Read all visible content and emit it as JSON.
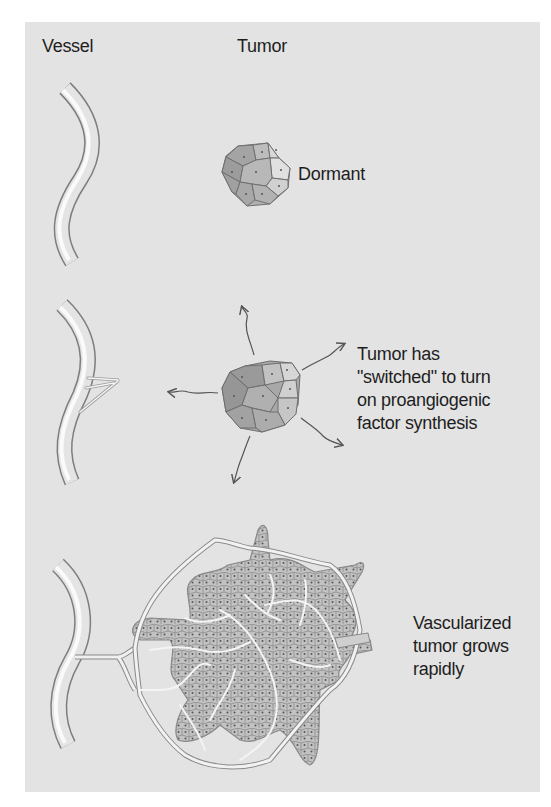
{
  "headers": {
    "vessel": "Vessel",
    "tumor": "Tumor"
  },
  "stages": [
    {
      "name": "dormant",
      "label_lines": [
        "Dormant"
      ]
    },
    {
      "name": "switched",
      "label_lines": [
        "Tumor has",
        "\"switched\" to turn",
        "on proangiogenic",
        "factor synthesis"
      ]
    },
    {
      "name": "vascularized",
      "label_lines": [
        "Vascularized",
        "tumor grows",
        "rapidly"
      ]
    }
  ],
  "colors": {
    "background": "#e3e3e3",
    "text": "#1e1e1e",
    "vessel_light": "#f2f2f2",
    "vessel_dark": "#8a8a8a",
    "cell_dark": "#9a9a9a",
    "cell_mid": "#b4b4b4",
    "cell_light": "#d8d8d8",
    "cell_border": "#6e6e6e",
    "arrow": "#555555"
  },
  "icons": {
    "vessel": "blood-vessel-illustration",
    "tumor": "tumor-cell-cluster-illustration",
    "arrow": "wavy-arrow"
  }
}
